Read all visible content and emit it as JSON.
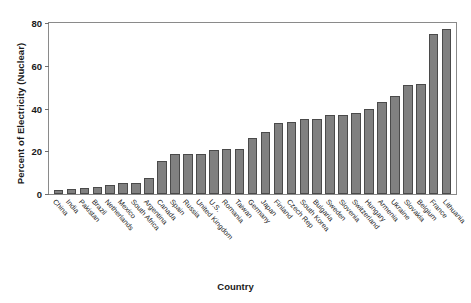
{
  "chart_data": {
    "type": "bar",
    "title": "",
    "xlabel": "Country",
    "ylabel": "Percent of Electricity (Nuclear)",
    "ylim": [
      0,
      80
    ],
    "yticks": [
      0,
      20,
      40,
      60,
      80
    ],
    "grid": false,
    "legend": false,
    "bar_color": "#808080",
    "bar_edge_color": "#4a4a4a",
    "categories": [
      "China",
      "India",
      "Pakistan",
      "Brazil",
      "Netherlands",
      "Mexico",
      "South Africa",
      "Argentina",
      "Canada",
      "Spain",
      "Russia",
      "United Kingdom",
      "U.S.",
      "Romania",
      "Taiwan",
      "Germany",
      "Japan",
      "Finland",
      "Czech Rep",
      "South Korea",
      "Bulgaria",
      "Sweden",
      "Slovenia",
      "Switzerland",
      "Hungary",
      "Armenia",
      "Ukraine",
      "Slovakia",
      "Belgium",
      "France",
      "Lithuania"
    ],
    "values": [
      2,
      2.5,
      3,
      3.5,
      4,
      5,
      5,
      7.5,
      15.5,
      18.5,
      18.5,
      18.5,
      20.5,
      21,
      21,
      26,
      29,
      33,
      33.5,
      35,
      35,
      37,
      37,
      38,
      40,
      43,
      46,
      51,
      51.5,
      75,
      77
    ],
    "units": "percent"
  },
  "axes": {
    "y_title": "Percent of Electricity (Nuclear)",
    "x_title": "Country"
  }
}
